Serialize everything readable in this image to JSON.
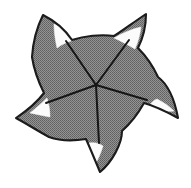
{
  "figure": {
    "name": "pentaradiate-spinose-specimen",
    "title": "Pentaradiate spinose specimen outline drawing",
    "render_style": "halftone-dither-scan",
    "symmetry": "pentaradial",
    "spine_count": 5,
    "septa_count": 5,
    "highlight_count": 5
  },
  "canvas": {
    "width": 191,
    "height": 188,
    "background_color": "#ffffff"
  },
  "colors": {
    "background": "#ffffff",
    "body_fill": "#808080",
    "body_fill_light": "#8d8d8d",
    "body_fill_dark": "#6e6e6e",
    "outline": "#1a1a1a",
    "septa_line": "#141414",
    "highlight_fill": "#fbfbfb",
    "halftone_dot": "#5a5a5a"
  },
  "geometry": {
    "center": {
      "x": 96,
      "y": 85
    },
    "outline_path": "M 43 15 C 57 22 66 31 72 40 C 84 36 101 34 114 36 C 122 31 134 22 146 14 C 146 26 143 38 138 48 C 146 56 153 66 158 77 C 166 83 174 96 178 118 C 167 112 155 106 144 103 C 139 112 131 123 122 131 C 122 144 112 162 100 172 C 95 160 90 148 86 139 C 74 141 60 141 49 137 C 38 131 27 124 16 118 C 28 110 38 101 44 93 C 39 83 34 70 32 57 C 33 42 37 27 43 15 Z",
    "spines": [
      {
        "id": "spine-top-left",
        "tip": {
          "x": 43,
          "y": 15
        },
        "angle_deg": 198,
        "hook_direction": "clockwise"
      },
      {
        "id": "spine-top-right",
        "tip": {
          "x": 146,
          "y": 14
        },
        "angle_deg": 306,
        "hook_direction": "clockwise"
      },
      {
        "id": "spine-right",
        "tip": {
          "x": 178,
          "y": 118
        },
        "angle_deg": 54,
        "hook_direction": "clockwise"
      },
      {
        "id": "spine-bottom",
        "tip": {
          "x": 100,
          "y": 172
        },
        "angle_deg": 126,
        "hook_direction": "clockwise"
      },
      {
        "id": "spine-left",
        "tip": {
          "x": 16,
          "y": 118
        },
        "angle_deg": 234,
        "hook_direction": "clockwise"
      }
    ],
    "septa": [
      {
        "id": "septum-upper-left",
        "from": {
          "x": 96,
          "y": 85
        },
        "to": {
          "x": 66,
          "y": 41
        }
      },
      {
        "id": "septum-upper-right",
        "from": {
          "x": 96,
          "y": 85
        },
        "to": {
          "x": 129,
          "y": 40
        }
      },
      {
        "id": "septum-right",
        "from": {
          "x": 96,
          "y": 85
        },
        "to": {
          "x": 147,
          "y": 100
        }
      },
      {
        "id": "septum-lower",
        "from": {
          "x": 96,
          "y": 85
        },
        "to": {
          "x": 99,
          "y": 143
        }
      },
      {
        "id": "septum-left",
        "from": {
          "x": 96,
          "y": 85
        },
        "to": {
          "x": 46,
          "y": 103
        }
      }
    ],
    "highlights": [
      {
        "id": "highlight-top-left",
        "path": "M 54 24 C 62 26 69 32 74 40 C 68 42 62 44 57 48 C 55 39 54 31 54 24 Z"
      },
      {
        "id": "highlight-top-right",
        "path": "M 141 27 C 140 35 138 42 135 49 C 128 45 121 41 114 38 C 122 33 132 29 141 27 Z"
      },
      {
        "id": "highlight-right",
        "path": "M 157 99 C 163 102 169 106 174 111 C 166 112 157 110 149 106 C 151 103 154 100 157 99 Z"
      },
      {
        "id": "highlight-bottom",
        "path": "M 89 143 C 94 142 99 143 103 146 C 101 153 98 159 95 165 C 92 158 90 150 89 143 Z"
      },
      {
        "id": "highlight-left",
        "path": "M 30 113 C 36 108 42 103 47 98 C 49 104 50 111 50 117 C 43 116 36 114 30 113 Z"
      }
    ]
  },
  "annotations": {
    "scale_bar_present": false,
    "labels": []
  }
}
